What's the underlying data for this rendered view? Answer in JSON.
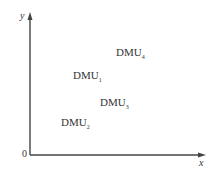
{
  "diagram": {
    "axes": {
      "x_label": "x",
      "y_label": "y",
      "origin_label": "0"
    },
    "points": [
      {
        "name": "DMU",
        "sub": "1",
        "x": 73,
        "y": 69
      },
      {
        "name": "DMU",
        "sub": "2",
        "x": 61,
        "y": 116
      },
      {
        "name": "DMU",
        "sub": "3",
        "x": 100,
        "y": 96
      },
      {
        "name": "DMU",
        "sub": "4",
        "x": 116,
        "y": 46
      }
    ],
    "colors": {
      "axis": "#444444",
      "text": "#333333"
    }
  }
}
